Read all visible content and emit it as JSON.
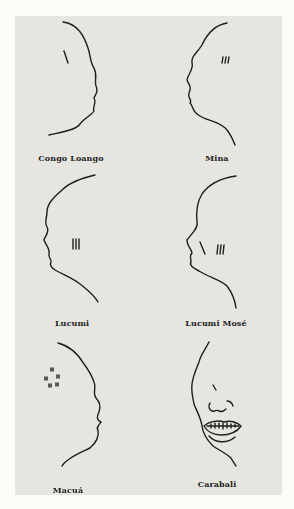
{
  "figure": {
    "panels": [
      {
        "id": "congo-loango",
        "label": "Congo Loango",
        "marks": "single diagonal stroke on temple"
      },
      {
        "id": "mina",
        "label": "Mina",
        "marks": "three vertical strokes on cheek"
      },
      {
        "id": "lucumi",
        "label": "Lucumi",
        "marks": "three vertical strokes on cheek"
      },
      {
        "id": "lucumi-mose",
        "label": "Lucumi Mosé",
        "marks": "one diagonal stroke plus three vertical strokes"
      },
      {
        "id": "macua",
        "label": "Macuá",
        "marks": "dotted circle of small marks on temple"
      },
      {
        "id": "carabali",
        "label": "Carabali",
        "marks": "filed/pointed teeth in open mouth"
      }
    ]
  },
  "colors": {
    "page_background": "#fbfbf8",
    "panel_background": "#e6e5e0",
    "ink": "#1e1e1e"
  }
}
